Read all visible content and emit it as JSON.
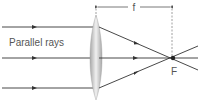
{
  "diagram": {
    "type": "convex-lens-ray-diagram",
    "labels": {
      "rays": "Parallel rays",
      "focal_length": "f",
      "focal_point": "F"
    },
    "colors": {
      "ray": "#333333",
      "dashed": "#888888",
      "text": "#555555",
      "lens_dark": "#9a9a9a",
      "lens_light": "#f2f2f2"
    }
  }
}
